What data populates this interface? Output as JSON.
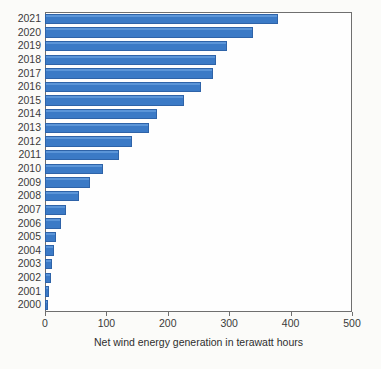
{
  "chart_data": {
    "type": "bar",
    "orientation": "horizontal",
    "title": "",
    "xlabel": "Net wind energy generation in terawatt hours",
    "ylabel": "",
    "xlim": [
      0,
      500
    ],
    "xticks": [
      0,
      100,
      200,
      300,
      400,
      500
    ],
    "xtick_labels": [
      "0",
      "100",
      "200",
      "300",
      "400",
      "500"
    ],
    "grid": false,
    "legend": false,
    "bar_color": "#3b7ac6",
    "bar_edge_color": "#2e63a8",
    "categories": [
      "2021",
      "2020",
      "2019",
      "2018",
      "2017",
      "2016",
      "2015",
      "2014",
      "2013",
      "2012",
      "2011",
      "2010",
      "2009",
      "2008",
      "2007",
      "2006",
      "2005",
      "2004",
      "2003",
      "2002",
      "2001",
      "2000"
    ],
    "values": [
      380,
      338,
      297,
      278,
      273,
      254,
      226,
      182,
      170,
      141,
      120,
      95,
      74,
      55,
      34,
      26,
      18,
      14,
      11,
      10,
      6,
      5
    ]
  }
}
